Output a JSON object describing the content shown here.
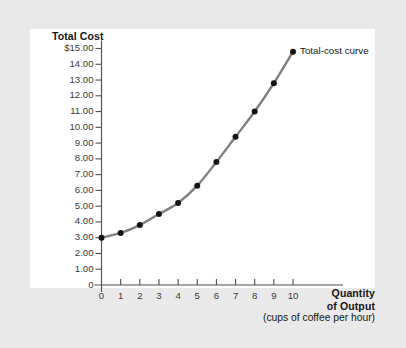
{
  "chart_data": {
    "type": "line",
    "title": "",
    "ylabel": "Total Cost",
    "xlabel": "Quantity of Output",
    "xlabel_line1": "Quantity",
    "xlabel_line2": "of Output",
    "xlabel_sub": "(cups of coffee per hour)",
    "x": [
      0,
      1,
      2,
      3,
      4,
      5,
      6,
      7,
      8,
      9,
      10
    ],
    "values": [
      3.0,
      3.3,
      3.8,
      4.5,
      5.2,
      6.3,
      7.8,
      9.4,
      11.0,
      12.8,
      14.8
    ],
    "series": [
      {
        "name": "Total-cost curve",
        "values": [
          3.0,
          3.3,
          3.8,
          4.5,
          5.2,
          6.3,
          7.8,
          9.4,
          11.0,
          12.8,
          14.8
        ]
      }
    ],
    "xlim": [
      0,
      10
    ],
    "ylim": [
      0,
      15
    ],
    "grid": false,
    "legend_position": "inline-right",
    "annotations": [
      "Total-cost curve"
    ],
    "y_tick_labels": [
      "$15.00",
      "14.00",
      "13.00",
      "12.00",
      "11.00",
      "10.00",
      "9.00",
      "8.00",
      "7.00",
      "6.00",
      "5.00",
      "4.00",
      "3.00",
      "2.00",
      "1.00",
      "0"
    ],
    "y_tick_values": [
      15,
      14,
      13,
      12,
      11,
      10,
      9,
      8,
      7,
      6,
      5,
      4,
      3,
      2,
      1,
      0
    ],
    "x_tick_labels": [
      "0",
      "1",
      "2",
      "3",
      "4",
      "5",
      "6",
      "7",
      "8",
      "9",
      "10"
    ],
    "x_tick_values": [
      0,
      1,
      2,
      3,
      4,
      5,
      6,
      7,
      8,
      9,
      10
    ],
    "colors": {
      "curve": "#7f7f7f",
      "marker": "#141414",
      "axis": "#4d4d4d",
      "text": "#161616",
      "panel": "#ffffff",
      "background": "#e9e9e9"
    }
  }
}
